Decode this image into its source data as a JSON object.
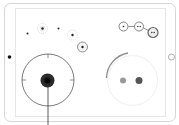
{
  "figure": {
    "device": {
      "orientation": "landscape",
      "frame_color": "#d8d8d8",
      "screen_border_color": "#e4e4e4",
      "camera_color": "#111111",
      "home_button_color": "#9a9a9a"
    },
    "gestures": {
      "tap_points": 4,
      "multi_touch_chain": [
        "1 finger",
        "2 fingers",
        "2 fingers"
      ],
      "press_target": "joystick-dial",
      "two_finger_rotate": true
    },
    "colors": {
      "dark_touch": "#1a1a1a",
      "mid_touch": "#555555",
      "light_touch": "#9a9a9a",
      "ring": "#555555",
      "halo": "#e6e6e6"
    }
  }
}
